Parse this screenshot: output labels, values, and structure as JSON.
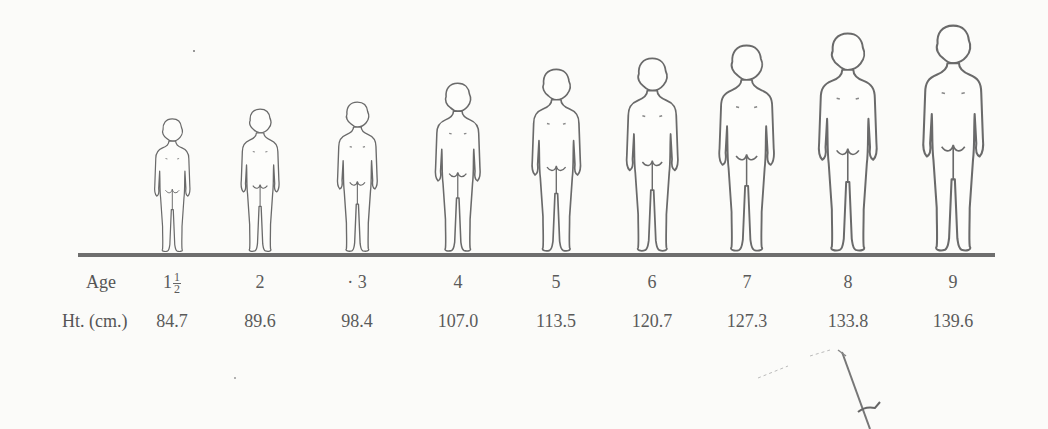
{
  "figure": {
    "type": "growth-series illustration",
    "subjects": "children viewed from behind, standing on a common baseline"
  },
  "table": {
    "row_labels": {
      "age": "Age",
      "height": "Ht. (cm.)"
    },
    "columns": [
      {
        "age": "1",
        "age_fraction": {
          "num": "1",
          "den": "2"
        },
        "height": "84.7",
        "x": 172,
        "top": 118
      },
      {
        "age": "2",
        "height": "89.6",
        "x": 260,
        "top": 108
      },
      {
        "age": "· 3",
        "height": "98.4",
        "x": 357,
        "top": 101
      },
      {
        "age": "4",
        "height": "107.0",
        "x": 458,
        "top": 82
      },
      {
        "age": "5",
        "height": "113.5",
        "x": 556,
        "top": 68
      },
      {
        "age": "6",
        "height": "120.7",
        "x": 652,
        "top": 57
      },
      {
        "age": "7",
        "height": "127.3",
        "x": 747,
        "top": 44
      },
      {
        "age": "8",
        "height": "133.8",
        "x": 848,
        "top": 32
      },
      {
        "age": "9",
        "height": "139.6",
        "x": 953,
        "top": 24
      }
    ]
  },
  "chart_data": {
    "type": "table",
    "title": "",
    "xlabel": "Age",
    "ylabel": "Ht. (cm.)",
    "categories": [
      "1 1/2",
      "2",
      "3",
      "4",
      "5",
      "6",
      "7",
      "8",
      "9"
    ],
    "values": [
      84.7,
      89.6,
      98.4,
      107.0,
      113.5,
      120.7,
      127.3,
      133.8,
      139.6
    ]
  },
  "colors": {
    "paper": "#fbfbf9",
    "ink": "#6e6e6e",
    "text": "#555555"
  }
}
